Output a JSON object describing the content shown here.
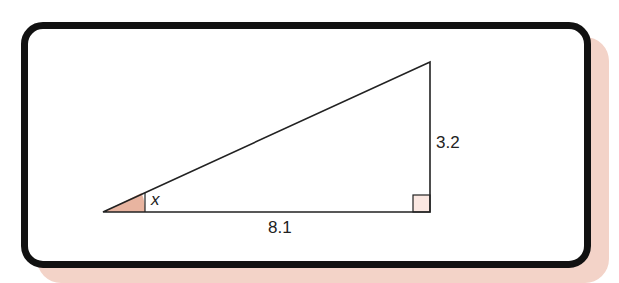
{
  "diagram": {
    "type": "right-triangle",
    "angle_label": "x",
    "base_label": "8.1",
    "height_label": "3.2",
    "colors": {
      "frame": "#111111",
      "shadow": "#f3d3c8",
      "angle_fill": "#e8b4a0",
      "right_angle_fill": "#fbe8e2",
      "line": "#222222"
    },
    "vertices": {
      "left": [
        103,
        212
      ],
      "right_angle": [
        430,
        212
      ],
      "top": [
        430,
        62
      ]
    }
  }
}
